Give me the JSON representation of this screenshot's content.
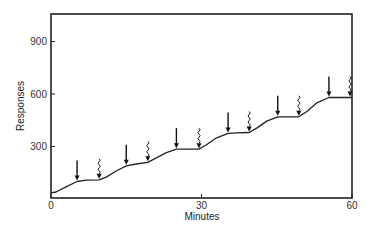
{
  "chart_data": {
    "type": "line",
    "title": "",
    "xlabel": "Minutes",
    "ylabel": "Responses",
    "xlim": [
      0,
      60
    ],
    "ylim": [
      0,
      1050
    ],
    "xticks": [
      0,
      30,
      60
    ],
    "xtick_labels": [
      "0",
      "30",
      "60"
    ],
    "yticks": [
      300,
      600,
      900
    ],
    "ytick_labels": [
      "300",
      "600",
      "900"
    ],
    "grid": false,
    "legend": "none",
    "series": [
      {
        "name": "Cumulative responses",
        "x": [
          0,
          1,
          3,
          5.2,
          7,
          9.6,
          11,
          13,
          15,
          17,
          19.3,
          21,
          23,
          25,
          27,
          29.5,
          31,
          33,
          35.3,
          37,
          39.5,
          41,
          43,
          45.2,
          47,
          49.4,
          51,
          53,
          55.4,
          57,
          59.6,
          60
        ],
        "y": [
          35,
          40,
          70,
          100,
          108,
          110,
          125,
          160,
          190,
          200,
          210,
          235,
          265,
          285,
          285,
          285,
          310,
          350,
          375,
          378,
          380,
          405,
          445,
          470,
          470,
          470,
          500,
          550,
          580,
          580,
          580,
          580
        ]
      }
    ],
    "annotations": [
      {
        "type": "straight-arrow",
        "x": 5.2
      },
      {
        "type": "wavy-arrow",
        "x": 9.6
      },
      {
        "type": "straight-arrow",
        "x": 15
      },
      {
        "type": "wavy-arrow",
        "x": 19.3
      },
      {
        "type": "straight-arrow",
        "x": 25
      },
      {
        "type": "wavy-arrow",
        "x": 29.5
      },
      {
        "type": "straight-arrow",
        "x": 35.3
      },
      {
        "type": "wavy-arrow",
        "x": 39.5
      },
      {
        "type": "straight-arrow",
        "x": 45.2
      },
      {
        "type": "wavy-arrow",
        "x": 49.4
      },
      {
        "type": "straight-arrow",
        "x": 55.4
      },
      {
        "type": "wavy-arrow",
        "x": 59.6
      }
    ]
  }
}
